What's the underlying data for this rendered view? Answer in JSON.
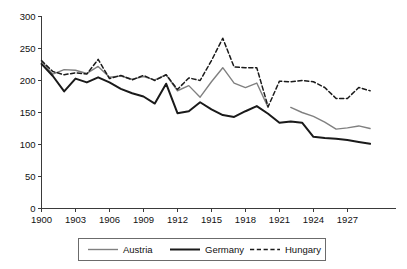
{
  "chart_data": {
    "type": "line",
    "title": "",
    "subtitle": "",
    "xlabel": "",
    "ylabel": "",
    "xlim": [
      1900,
      1929
    ],
    "ylim": [
      0,
      300
    ],
    "grid": false,
    "legend_position": "bottom",
    "y_ticks": [
      0,
      50,
      100,
      150,
      200,
      250,
      300
    ],
    "y_tick_labels": [
      "0",
      "50",
      "100",
      "150",
      "200",
      "250",
      "300"
    ],
    "x_ticks": [
      1900,
      1903,
      1906,
      1909,
      1912,
      1915,
      1918,
      1921,
      1924,
      1927
    ],
    "x_tick_labels": [
      "1900",
      "1903",
      "1906",
      "1909",
      "1912",
      "1915",
      "1918",
      "1921",
      "1924",
      "1927"
    ],
    "x": [
      1900,
      1901,
      1902,
      1903,
      1904,
      1905,
      1906,
      1907,
      1908,
      1909,
      1910,
      1911,
      1912,
      1913,
      1914,
      1915,
      1916,
      1917,
      1918,
      1919,
      1920,
      1921,
      1922,
      1923,
      1924,
      1925,
      1926,
      1927,
      1928,
      1929
    ],
    "series": [
      {
        "name": "Austria",
        "color": "#808080",
        "style": "solid",
        "width": 1.4,
        "x": [
          1900,
          1901,
          1902,
          1903,
          1904,
          1905,
          1906,
          1907,
          1908,
          1909,
          1910,
          1911,
          1912,
          1913,
          1914,
          1915,
          1916,
          1917,
          1918,
          1919,
          1920,
          1922,
          1923,
          1924,
          1925,
          1926,
          1927,
          1928,
          1929
        ],
        "values": [
          230,
          210,
          217,
          216,
          211,
          222,
          205,
          207,
          202,
          206,
          201,
          209,
          184,
          192,
          174,
          198,
          220,
          196,
          189,
          196,
          158,
          158,
          150,
          144,
          135,
          124,
          126,
          129,
          125
        ],
        "gap_after": 1920
      },
      {
        "name": "Germany",
        "color": "#1a1a1a",
        "style": "solid",
        "width": 2.0,
        "x": [
          1900,
          1901,
          1902,
          1903,
          1904,
          1905,
          1906,
          1907,
          1908,
          1909,
          1910,
          1911,
          1912,
          1913,
          1914,
          1915,
          1916,
          1917,
          1918,
          1919,
          1920,
          1921,
          1922,
          1923,
          1924,
          1925,
          1926,
          1927,
          1928,
          1929
        ],
        "values": [
          226,
          207,
          183,
          203,
          197,
          205,
          197,
          187,
          180,
          175,
          164,
          195,
          149,
          152,
          166,
          155,
          146,
          143,
          152,
          160,
          148,
          134,
          136,
          134,
          112,
          110,
          109,
          107,
          104,
          101
        ]
      },
      {
        "name": "Hungary",
        "color": "#1a1a1a",
        "style": "dashed",
        "width": 1.5,
        "x": [
          1900,
          1901,
          1902,
          1903,
          1904,
          1905,
          1906,
          1907,
          1908,
          1909,
          1910,
          1911,
          1912,
          1913,
          1914,
          1915,
          1916,
          1917,
          1918,
          1919,
          1920,
          1921,
          1922,
          1923,
          1924,
          1925,
          1926,
          1927,
          1928,
          1929
        ],
        "values": [
          231,
          214,
          209,
          212,
          210,
          233,
          203,
          208,
          201,
          208,
          200,
          209,
          186,
          204,
          200,
          231,
          266,
          221,
          220,
          220,
          159,
          199,
          198,
          200,
          198,
          189,
          172,
          172,
          189,
          184
        ]
      }
    ]
  },
  "legend": {
    "items": [
      {
        "label": "Austria"
      },
      {
        "label": "Germany"
      },
      {
        "label": "Hungary"
      }
    ]
  }
}
